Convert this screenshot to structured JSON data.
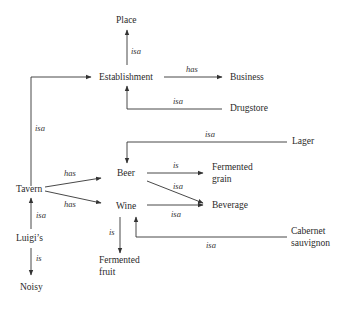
{
  "diagram": {
    "type": "semantic-network",
    "colors": {
      "ink": "#2a2a2a",
      "background": "#ffffff"
    },
    "nodes": {
      "place": "Place",
      "establishment": "Establishment",
      "business": "Business",
      "drugstore": "Drugstore",
      "lager": "Lager",
      "beer": "Beer",
      "tavern": "Tavern",
      "wine": "Wine",
      "fermented_grain_1": "Fermented",
      "fermented_grain_2": "grain",
      "beverage": "Beverage",
      "cabernet_1": "Cabernet",
      "cabernet_2": "sauvignon",
      "fermented_fruit_1": "Fermented",
      "fermented_fruit_2": "fruit",
      "luigis": "Luigi’s",
      "noisy": "Noisy"
    },
    "edges": [
      {
        "from": "Establishment",
        "to": "Place",
        "label": "isa"
      },
      {
        "from": "Establishment",
        "to": "Business",
        "label": "has"
      },
      {
        "from": "Drugstore",
        "to": "Establishment",
        "label": "isa"
      },
      {
        "from": "Tavern",
        "to": "Establishment",
        "label": "isa"
      },
      {
        "from": "Lager",
        "to": "Beer",
        "label": "isa"
      },
      {
        "from": "Tavern",
        "to": "Beer",
        "label": "has"
      },
      {
        "from": "Tavern",
        "to": "Wine",
        "label": "has"
      },
      {
        "from": "Beer",
        "to": "Fermented grain",
        "label": "is"
      },
      {
        "from": "Beer",
        "to": "Beverage",
        "label": "isa"
      },
      {
        "from": "Wine",
        "to": "Beverage",
        "label": "isa"
      },
      {
        "from": "Cabernet sauvignon",
        "to": "Wine",
        "label": "isa"
      },
      {
        "from": "Wine",
        "to": "Fermented fruit",
        "label": "is"
      },
      {
        "from": "Luigi’s",
        "to": "Tavern",
        "label": "isa"
      },
      {
        "from": "Luigi’s",
        "to": "Noisy",
        "label": "is"
      }
    ]
  }
}
